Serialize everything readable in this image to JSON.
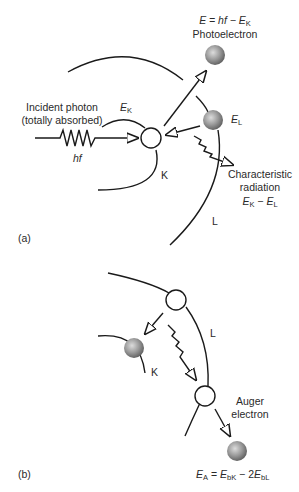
{
  "panel_a": {
    "tag": "(a)",
    "photoelectron": {
      "equation_lhs": "E",
      "equation_mid": " = hf − ",
      "equation_rhs": "E",
      "equation_rhs_sub": "K",
      "label": "Photoelectron"
    },
    "incident_photon": {
      "line1": "Incident photon",
      "line2": "(totally absorbed)",
      "energy": "hf"
    },
    "shell_k": {
      "energy_symbol": "E",
      "energy_sub": "K",
      "label": "K"
    },
    "shell_l": {
      "energy_symbol": "E",
      "energy_sub": "L",
      "label": "L"
    },
    "characteristic_radiation": {
      "line1": "Characteristic",
      "line2": "radiation",
      "eq_a": "E",
      "eq_a_sub": "K",
      "eq_op": " − ",
      "eq_b": "E",
      "eq_b_sub": "L"
    }
  },
  "panel_b": {
    "tag": "(b)",
    "shell_l_label": "L",
    "shell_k_label": "K",
    "auger": {
      "line1": "Auger",
      "line2": "electron",
      "eq_lhs": "E",
      "eq_lhs_sub": "A",
      "eq_eq": " = ",
      "eq_t1": "E",
      "eq_t1_sub": "bK",
      "eq_op": " − 2",
      "eq_t2": "E",
      "eq_t2_sub": "bL"
    }
  },
  "colors": {
    "line": "#1a1a1a",
    "electron_fill_center": "#d8d8d8",
    "electron_fill_edge": "#6e6e6e"
  }
}
